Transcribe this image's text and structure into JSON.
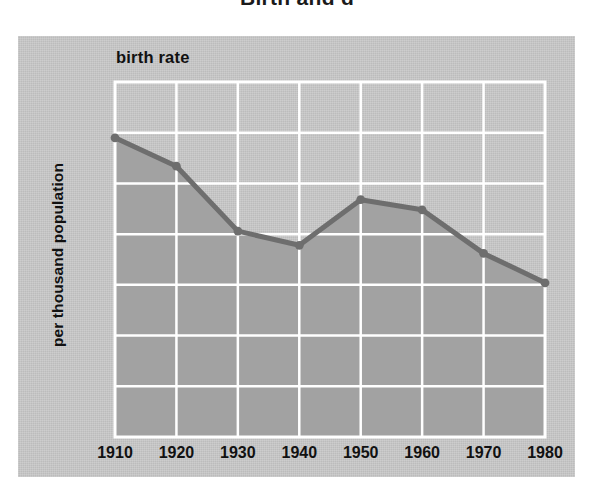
{
  "page": {
    "title": "Birth and d",
    "background_color": "#ffffff"
  },
  "figure": {
    "panel_color": "#c9c9c9",
    "plot_fill_color": "#a2a2a2",
    "line_color": "#6e6e6e",
    "gridline_color": "#ffffff",
    "axis_color": "#ffffff",
    "series_label": "birth rate",
    "y_axis_title": "per thousand population"
  },
  "chart_data": {
    "type": "area",
    "title": "birth rate",
    "xlabel": "",
    "ylabel": "per thousand population",
    "x": [
      1910,
      1920,
      1930,
      1940,
      1950,
      1960,
      1970,
      1980
    ],
    "xtick_labels": [
      "1910",
      "1920",
      "1930",
      "1940",
      "1950",
      "1960",
      "1970",
      "1980"
    ],
    "values": [
      29.5,
      26.7,
      20.3,
      18.9,
      23.4,
      22.4,
      18.1,
      15.2
    ],
    "ytick_labels": [
      "0",
      "5",
      "10",
      "15",
      "20",
      "25",
      "30",
      "35"
    ],
    "yticks": [
      0,
      5,
      10,
      15,
      20,
      25,
      30,
      35
    ],
    "ylim": [
      0,
      35
    ],
    "xlim": [
      1910,
      1980
    ],
    "grid": true,
    "legend": "none",
    "markers": true
  }
}
